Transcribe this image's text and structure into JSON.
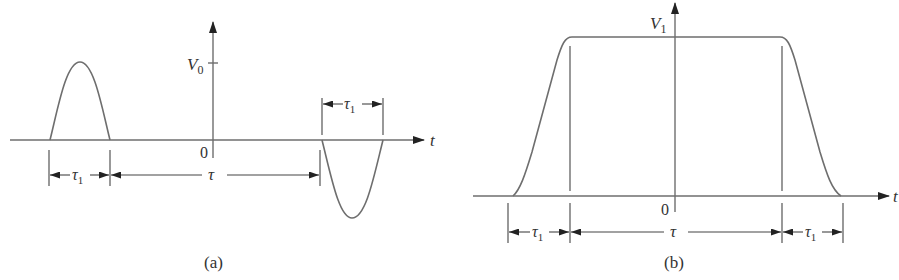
{
  "figure": {
    "panels": [
      {
        "id": "a",
        "caption": "(a)",
        "axis": {
          "y_label": "V",
          "y_label_sub": "0",
          "origin_label": "0",
          "x_label": "t"
        },
        "dimensions": [
          {
            "label": "τ",
            "sub": "1"
          },
          {
            "label": "τ",
            "sub": ""
          },
          {
            "label": "τ",
            "sub": "1"
          }
        ],
        "description": "Positive half-sine pulse of width τ1 and amplitude V0, followed after interval τ by a negative half-sine pulse of width τ1"
      },
      {
        "id": "b",
        "caption": "(b)",
        "axis": {
          "y_label": "V",
          "y_label_sub": "1",
          "origin_label": "0",
          "x_label": "t"
        },
        "dimensions": [
          {
            "label": "τ",
            "sub": "1"
          },
          {
            "label": "τ",
            "sub": ""
          },
          {
            "label": "τ",
            "sub": "1"
          }
        ],
        "description": "Trapezoidal pulse of height V1 with rise time τ1, flat top of duration τ, and fall time τ1"
      }
    ],
    "colors": {
      "waveform": "#6e6e6e",
      "dimension": "#444444",
      "text": "#333333"
    }
  }
}
